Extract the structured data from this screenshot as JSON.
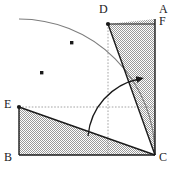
{
  "figure": {
    "type": "geometry-diagram",
    "width": 173,
    "height": 170,
    "background_color": "#ffffff",
    "stroke_color": "#1a1a1a",
    "hatch_color": "#8c8c8c",
    "dotted_color": "#9a9a9a",
    "arc_color": "#6e6e6e"
  },
  "labels": [
    {
      "id": "label-A",
      "text": "A",
      "x": 159,
      "y": 6
    },
    {
      "id": "label-F",
      "text": "F",
      "x": 159,
      "y": 18
    },
    {
      "id": "label-D",
      "text": "D",
      "x": 100,
      "y": 6
    },
    {
      "id": "label-E",
      "text": "E",
      "x": 5,
      "y": 100
    },
    {
      "id": "label-B",
      "text": "B",
      "x": 4,
      "y": 152
    },
    {
      "id": "label-C",
      "text": "C",
      "x": 159,
      "y": 152
    }
  ],
  "points": {
    "A": {
      "x": 155,
      "y": 19
    },
    "F": {
      "x": 155,
      "y": 24
    },
    "D": {
      "x": 108,
      "y": 24
    },
    "E": {
      "x": 19,
      "y": 107
    },
    "B": {
      "x": 19,
      "y": 155
    },
    "C": {
      "x": 155,
      "y": 155
    }
  },
  "arc_markers": [
    {
      "id": "arc-point-1",
      "x": 42,
      "y": 73
    },
    {
      "id": "arc-point-2",
      "x": 72,
      "y": 43
    }
  ],
  "segments": [
    {
      "id": "segment-BC",
      "from": "B",
      "to": "C"
    },
    {
      "id": "segment-CA",
      "from": "C",
      "to": "A"
    },
    {
      "id": "segment-EB",
      "from": "E",
      "to": "B"
    },
    {
      "id": "segment-EC",
      "from": "E",
      "to": "C"
    },
    {
      "id": "segment-DC",
      "from": "D",
      "to": "C"
    },
    {
      "id": "segment-DF",
      "from": "D",
      "to": "F"
    }
  ],
  "dotted_guides": [
    {
      "id": "guide-vertical-D",
      "x1": 108,
      "y1": 24,
      "x2": 108,
      "y2": 155
    },
    {
      "id": "guide-horizontal-E",
      "x1": 19,
      "y1": 107,
      "x2": 155,
      "y2": 107
    }
  ],
  "quarter_arc": {
    "id": "quarter-circle-arc",
    "center_x": 19,
    "center_y": 155,
    "radius": 136,
    "from_x": 19,
    "from_y": 19,
    "to_x": 155,
    "to_y": 155
  },
  "rotation_arrow": {
    "id": "rotation-angle-arrow",
    "start_x": 88,
    "start_y": 136,
    "end_x": 140,
    "end_y": 78,
    "radius": 64,
    "arrow_direction": "right"
  },
  "hatched_regions": [
    {
      "id": "region-upper-DCAF",
      "vertices": "108,24 155,19 155,155"
    },
    {
      "id": "region-lower-EBC",
      "vertices": "19,107 19,155 155,155"
    }
  ]
}
